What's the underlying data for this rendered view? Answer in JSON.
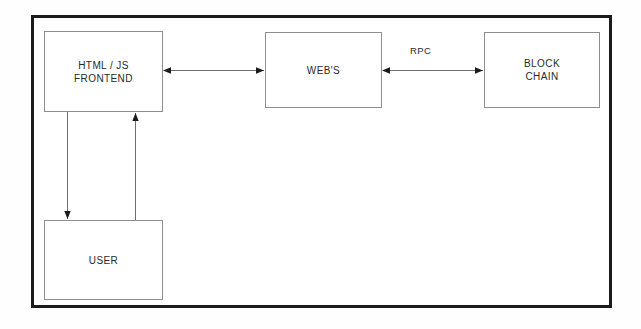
{
  "diagram": {
    "type": "block-diagram",
    "canvas": {
      "width": 641,
      "height": 329
    },
    "frame": {
      "stroke": "#1b1b1b",
      "fill": "#ffffff"
    },
    "node_stroke": "#8e8e8e",
    "text_color": "#2a2a2a",
    "nodes": [
      {
        "id": "frontend",
        "label": "HTML / JS\nFRONTEND",
        "x": 44,
        "y": 31,
        "width": 119,
        "height": 81
      },
      {
        "id": "webs",
        "label": "WEB'S",
        "x": 265,
        "y": 32,
        "width": 117,
        "height": 76
      },
      {
        "id": "blockchain",
        "label": "BLOCK\nCHAIN",
        "x": 484,
        "y": 32,
        "width": 116,
        "height": 76
      },
      {
        "id": "user",
        "label": "USER",
        "x": 44,
        "y": 220,
        "width": 119,
        "height": 80
      }
    ],
    "edges": [
      {
        "id": "frontend-webs",
        "from": "frontend",
        "to": "webs",
        "direction": "bidirectional",
        "label": ""
      },
      {
        "id": "webs-blockchain",
        "from": "webs",
        "to": "blockchain",
        "direction": "bidirectional",
        "label": "RPC"
      },
      {
        "id": "frontend-user",
        "from": "frontend",
        "to": "user",
        "direction": "down",
        "label": ""
      },
      {
        "id": "user-frontend",
        "from": "user",
        "to": "frontend",
        "direction": "up",
        "label": ""
      }
    ]
  }
}
